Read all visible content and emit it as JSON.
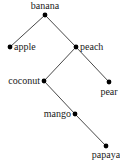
{
  "diagram": {
    "type": "tree",
    "nodes": [
      {
        "id": "banana",
        "label": "banana",
        "x": 45,
        "y": 15,
        "lx": 45,
        "ly": 9,
        "anchor": "middle"
      },
      {
        "id": "apple",
        "label": "apple",
        "x": 10,
        "y": 47,
        "lx": 14,
        "ly": 50,
        "anchor": "start"
      },
      {
        "id": "peach",
        "label": "peach",
        "x": 76,
        "y": 47,
        "lx": 80,
        "ly": 50,
        "anchor": "start"
      },
      {
        "id": "coconut",
        "label": "coconut",
        "x": 44,
        "y": 81,
        "lx": 40,
        "ly": 84,
        "anchor": "end"
      },
      {
        "id": "pear",
        "label": "pear",
        "x": 109,
        "y": 82,
        "lx": 109,
        "ly": 95,
        "anchor": "middle"
      },
      {
        "id": "mango",
        "label": "mango",
        "x": 75,
        "y": 114,
        "lx": 71,
        "ly": 117,
        "anchor": "end"
      },
      {
        "id": "papaya",
        "label": "papaya",
        "x": 106,
        "y": 146,
        "lx": 106,
        "ly": 158,
        "anchor": "middle"
      }
    ],
    "edges": [
      [
        "banana",
        "apple"
      ],
      [
        "banana",
        "peach"
      ],
      [
        "peach",
        "coconut"
      ],
      [
        "peach",
        "pear"
      ],
      [
        "coconut",
        "mango"
      ],
      [
        "mango",
        "papaya"
      ]
    ]
  }
}
